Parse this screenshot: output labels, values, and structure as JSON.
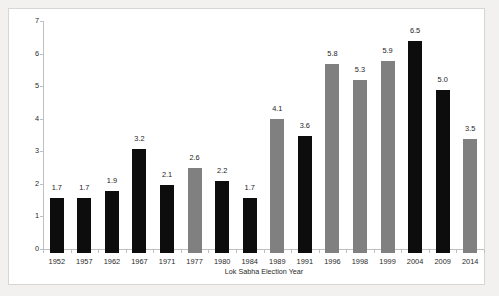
{
  "chart_data": {
    "type": "bar",
    "title": "",
    "xlabel": "Lok Sabha Election Year",
    "ylabel": "Number of Parties (Weighted by Actual Seats Won)",
    "ylim": [
      0,
      7
    ],
    "yticks": [
      "0",
      "1",
      "2",
      "3",
      "4",
      "5",
      "6",
      "7"
    ],
    "grid": false,
    "legend": "none",
    "categories": [
      "1952",
      "1957",
      "1962",
      "1967",
      "1971",
      "1977",
      "1980",
      "1984",
      "1989",
      "1991",
      "1996",
      "1998",
      "1999",
      "2004",
      "2009",
      "2014"
    ],
    "values": [
      1.7,
      1.7,
      1.9,
      3.2,
      2.1,
      2.6,
      2.2,
      1.7,
      4.1,
      3.6,
      5.8,
      5.3,
      5.9,
      6.5,
      5.0,
      3.5
    ],
    "value_labels": [
      "1.7",
      "1.7",
      "1.9",
      "3.2",
      "2.1",
      "2.6",
      "2.2",
      "1.7",
      "4.1",
      "3.6",
      "5.8",
      "5.3",
      "5.9",
      "6.5",
      "5.0",
      "3.5"
    ],
    "bar_colors": [
      "#0d0d0d",
      "#0d0d0d",
      "#0d0d0d",
      "#0d0d0d",
      "#0d0d0d",
      "#808080",
      "#0d0d0d",
      "#0d0d0d",
      "#808080",
      "#0d0d0d",
      "#808080",
      "#808080",
      "#808080",
      "#0d0d0d",
      "#0d0d0d",
      "#808080"
    ],
    "colors": {
      "black_bar": "#0d0d0d",
      "gray_bar": "#808080",
      "axis": "#bfbfbf",
      "text": "#2b2b2b",
      "frame_border": "#d6d6d6",
      "plot_background": "#ffffff",
      "page_background": "#f2f1ef"
    }
  }
}
